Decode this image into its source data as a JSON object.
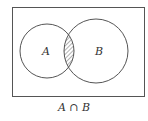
{
  "diagram": {
    "type": "venn",
    "sets": [
      {
        "label": "A",
        "cx": 47,
        "cy": 51,
        "r": 27
      },
      {
        "label": "B",
        "cx": 96,
        "cy": 51,
        "r": 32
      }
    ],
    "shaded_region": "intersection",
    "caption": "A ∩ B",
    "colors": {
      "stroke": "#555555",
      "hatch": "#666666",
      "background": "#ffffff"
    }
  }
}
